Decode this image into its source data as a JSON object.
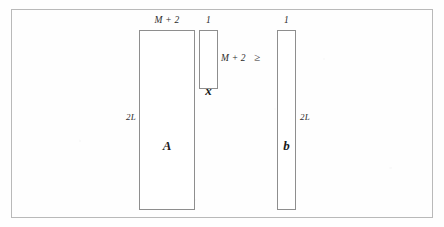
{
  "diagram": {
    "relation": "≥",
    "blocks": [
      {
        "id": "A",
        "symbol": "A",
        "top_dim": "M + 2",
        "left_dim": "2L",
        "right_dim": "",
        "role": "coefficient-matrix"
      },
      {
        "id": "x",
        "symbol": "x",
        "top_dim": "1",
        "left_dim": "",
        "right_dim": "M + 2",
        "role": "variable-vector"
      },
      {
        "id": "b",
        "symbol": "b",
        "top_dim": "1",
        "left_dim": "",
        "right_dim": "2L",
        "role": "rhs-vector"
      }
    ]
  },
  "colors": {
    "frame": "#b9b9b9",
    "block_border": "#8e8e8e",
    "text": "#1b1b1b",
    "dim_text": "#2b2b2b",
    "background": "#fefefe"
  }
}
